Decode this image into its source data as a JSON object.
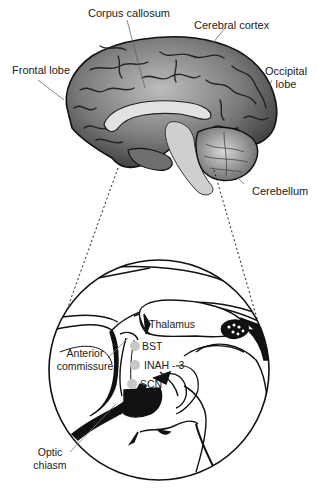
{
  "figure": {
    "type": "brain anatomy diagram",
    "top_view": "medial sagittal section of human brain",
    "inset_view": "magnified hypothalamic region"
  },
  "brain_labels": {
    "corpus_callosum": "Corpus callosum",
    "cerebral_cortex": "Cerebral cortex",
    "frontal_lobe": "Frontal lobe",
    "occipital_lobe_1": "Occipital",
    "occipital_lobe_2": "lobe",
    "cerebellum": "Cerebellum"
  },
  "inset_labels": {
    "thalamus": "Thalamus",
    "bst": "BST",
    "inah3": "INAH - 3",
    "scn": "SCN",
    "anterior_commissure_1": "Anterior",
    "anterior_commissure_2": "commissure",
    "optic_chiasm_1": "Optic",
    "optic_chiasm_2": "chiasm"
  },
  "colors": {
    "line": "#111111",
    "nucleus_dot": "#c8c8c8",
    "leader_line": "#777777",
    "brain_base": "#8a8a8a"
  }
}
